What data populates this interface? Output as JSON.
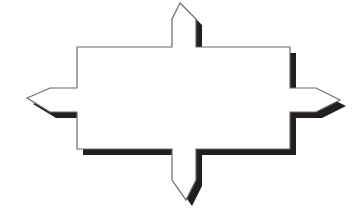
{
  "figure": {
    "name": "four-directional-arrow-outline",
    "canvas": {
      "width": 361,
      "height": 219
    },
    "colors": {
      "background": "#ffffff",
      "outline": "#6b6b6b",
      "shadow": "#231f20",
      "fill": "#ffffff"
    },
    "stroke_width": 1.2,
    "shape": {
      "type": "cross-arrow",
      "arrow_count": 4,
      "directions": [
        "up",
        "left",
        "right",
        "down"
      ],
      "body": {
        "left": 77,
        "top": 47,
        "right": 290,
        "bottom": 149
      },
      "arrows": [
        {
          "direction": "up",
          "tip": {
            "x": 180,
            "y": 3
          },
          "shaft_left": 172,
          "shaft_right": 196,
          "shoulder_y": 19,
          "base_y": 47
        },
        {
          "direction": "left",
          "tip": {
            "x": 27,
            "y": 98
          },
          "shaft_top": 88,
          "shaft_bottom": 112,
          "shoulder_x": 50,
          "base_x": 77
        },
        {
          "direction": "right",
          "tip": {
            "x": 340,
            "y": 100
          },
          "shaft_top": 88,
          "shaft_bottom": 112,
          "shoulder_x": 316,
          "base_x": 290
        },
        {
          "direction": "down",
          "tip": {
            "x": 186,
            "y": 200
          },
          "shaft_left": 172,
          "shaft_right": 196,
          "shoulder_y": 180,
          "base_y": 149
        }
      ],
      "shadow": {
        "offset_x": 6,
        "offset_y": 6,
        "sides": [
          "right",
          "bottom"
        ]
      }
    },
    "outline_path": "M 180 3 L 196 19 L 196 47 L 290 47 L 290 88 L 316 88 L 340 100 L 316 112 L 290 112 L 290 149 L 196 149 L 196 180 L 186 200 L 172 180 L 172 149 L 77 149 L 77 112 L 50 112 L 27 98 L 50 88 L 77 88 L 77 47 L 172 47 L 172 19 Z",
    "shadow_path": "M 186 9 L 202 25 L 202 53 L 296 53 L 296 94 L 322 94 L 346 106 L 322 118 L 296 118 L 296 155 L 202 155 L 202 186 L 192 206 L 178 186 L 178 155 L 83 155 L 83 118 L 56 118 L 33 104 L 56 94 L 83 94 L 83 53 L 178 53 L 178 25 Z"
  }
}
